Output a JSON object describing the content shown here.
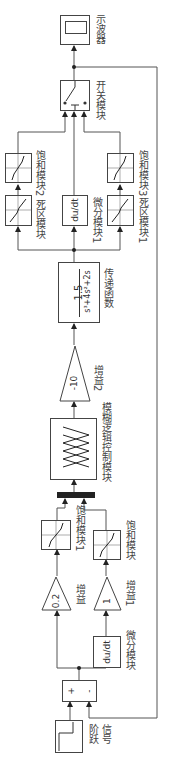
{
  "diagram": {
    "orientation": "rotated-90-ccw",
    "blocks": {
      "step": {
        "label_line1": "阶跃",
        "label_line2": "信号"
      },
      "sum": {
        "plus": "+",
        "minus": "-"
      },
      "gain_a": {
        "value": "0.2",
        "label": "增益"
      },
      "gain_b": {
        "value": "1",
        "label": "增益1"
      },
      "derivative_a": {
        "expr": "du/dt",
        "label": "微分模块"
      },
      "saturation_a": {
        "label": "饱和模块1"
      },
      "saturation_b": {
        "label": "饱和模块"
      },
      "mux": {
        "label": ""
      },
      "fuzzy": {
        "label": "模糊逻辑控制模块"
      },
      "gain_c": {
        "value": "-10",
        "label": "增益2"
      },
      "transfer_fn": {
        "numerator": "1.5",
        "denominator": "s³+4s²+2s",
        "label": "传递函数"
      },
      "deadzone_a": {
        "label": "死区模块"
      },
      "saturation_c": {
        "label": "饱和模块2"
      },
      "derivative_b": {
        "expr": "du/dt",
        "label": "微分模块1"
      },
      "deadzone_b": {
        "label": "死区模块1"
      },
      "saturation_d": {
        "label": "饱和模块3"
      },
      "switch": {
        "label": "开关模块"
      },
      "scope": {
        "label": "示波器"
      }
    },
    "colors": {
      "line": "#444444",
      "background": "#ffffff"
    }
  }
}
